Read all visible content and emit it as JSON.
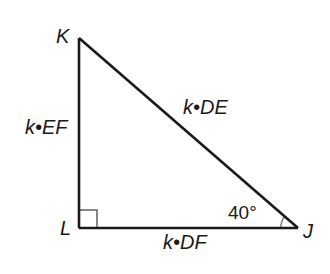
{
  "figure": {
    "type": "right-triangle",
    "vertices": {
      "K": {
        "label": "K",
        "x": 79,
        "y": 38
      },
      "L": {
        "label": "L",
        "x": 79,
        "y": 228
      },
      "J": {
        "label": "J",
        "x": 298,
        "y": 228
      }
    },
    "sides": {
      "KL": {
        "label": "k•EF"
      },
      "KJ": {
        "label": "k•DE"
      },
      "LJ": {
        "label": "k•DF"
      }
    },
    "angles": {
      "J": {
        "label": "40°"
      },
      "L": {
        "marker": "right-angle-square"
      }
    },
    "colors": {
      "stroke": "#1a1a1a",
      "arc": "#777777"
    }
  }
}
